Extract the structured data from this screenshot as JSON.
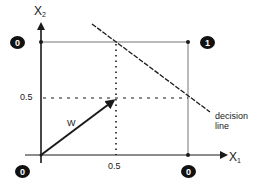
{
  "diagram": {
    "x_axis_label": "X",
    "x_axis_subscript": "1",
    "y_axis_label": "X",
    "y_axis_subscript": "2",
    "x_tick": "0.5",
    "y_tick": "0.5",
    "vector_label": "W",
    "decision_line_label_1": "decision",
    "decision_line_label_2": "line",
    "corners": [
      {
        "position": "origin",
        "value": "0"
      },
      {
        "position": "top-left",
        "value": "0"
      },
      {
        "position": "top-right",
        "value": "1"
      },
      {
        "position": "bottom-right",
        "value": "0"
      }
    ],
    "colors": {
      "ink": "#1a1a1a",
      "grid": "#555555",
      "badge_bg": "#111111",
      "badge_text": "#ffffff",
      "background": "#ffffff"
    }
  }
}
